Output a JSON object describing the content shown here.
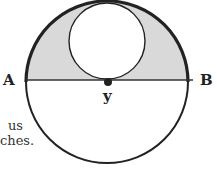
{
  "figure": {
    "labels": {
      "point_a": "A",
      "point_b": "B",
      "center_point": "y"
    },
    "text_fragments": [
      "us",
      "ches."
    ],
    "colors": {
      "shaded_region": "#d9d9d9",
      "stroke": "#222222",
      "background": "#ffffff"
    },
    "geometry": {
      "large_circle": {
        "cx": 107,
        "cy": 82,
        "r": 81
      },
      "small_circle": {
        "cx": 107,
        "cy": 41,
        "r": 39
      },
      "diameter_AB": {
        "y": 80
      },
      "center_dot": {
        "cx": 108,
        "cy": 82,
        "r": 4
      }
    }
  }
}
